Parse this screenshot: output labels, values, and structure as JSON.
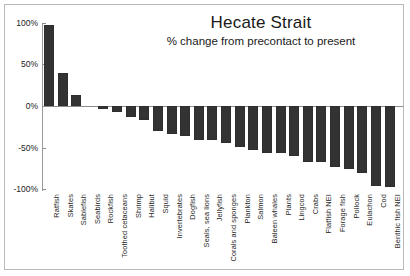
{
  "chart_data": {
    "type": "bar",
    "title": "Hecate Strait",
    "subtitle": "% change from precontact to present",
    "xlabel": "",
    "ylabel": "",
    "ylim": [
      -100,
      100
    ],
    "grid": false,
    "legend": null,
    "ytick_labels": [
      "100%",
      "50%",
      "0%",
      "-50%",
      "-100%"
    ],
    "ytick_values": [
      100,
      50,
      0,
      -50,
      -100
    ],
    "units": "percent",
    "bar_color": "#333333",
    "categories": [
      "Ratfish",
      "Skates",
      "Sablefish",
      "Seabirds",
      "Rockfish",
      "Toothed cetaceans",
      "Shrimp",
      "Halibut",
      "Squid",
      "Invertebrates",
      "Dogfish",
      "Seals, sea lions",
      "Jellyfish",
      "Corals and sponges",
      "Plankton",
      "Salmon",
      "Baleen whales",
      "Plants",
      "Lingcod",
      "Crabs",
      "Flatfish NEI",
      "Forage fish",
      "Pollock",
      "Eulachon",
      "Cod",
      "Benthic fish NEI"
    ],
    "values": [
      97,
      40,
      13,
      0,
      -3,
      -7,
      -13,
      -17,
      -30,
      -34,
      -36,
      -41,
      -41,
      -44,
      -49,
      -53,
      -56,
      -56,
      -60,
      -67,
      -67,
      -73,
      -75,
      -80,
      -96,
      -97
    ]
  }
}
